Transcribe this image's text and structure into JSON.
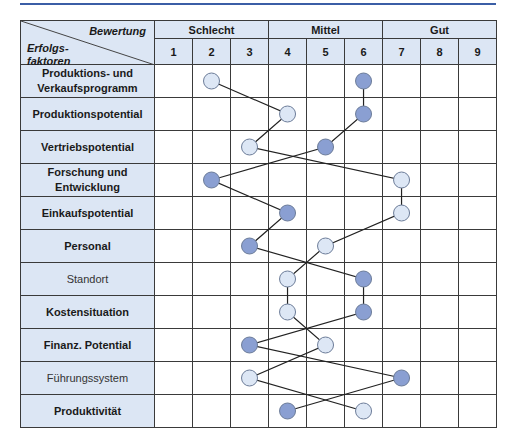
{
  "header": {
    "corner_top": "Bewertung",
    "corner_bottom": "Erfolgs-\nfaktoren",
    "groups": [
      {
        "label": "Schlecht",
        "span": 3
      },
      {
        "label": "Mittel",
        "span": 3
      },
      {
        "label": "Gut",
        "span": 3
      }
    ],
    "scale": [
      "1",
      "2",
      "3",
      "4",
      "5",
      "6",
      "7",
      "8",
      "9"
    ]
  },
  "rows": [
    {
      "label": "Produktions- und Verkaufsprogramm",
      "bold": true,
      "light": 2,
      "dark": 6
    },
    {
      "label": "Produktionspotential",
      "bold": true,
      "light": 4,
      "dark": 6
    },
    {
      "label": "Vertriebspotential",
      "bold": true,
      "light": 3,
      "dark": 5
    },
    {
      "label": "Forschung und Entwicklung",
      "bold": true,
      "light": 7,
      "dark": 2
    },
    {
      "label": "Einkaufspotential",
      "bold": true,
      "light": 7,
      "dark": 4
    },
    {
      "label": "Personal",
      "bold": true,
      "light": 5,
      "dark": 3
    },
    {
      "label": "Standort",
      "bold": false,
      "light": 4,
      "dark": 6
    },
    {
      "label": "Kostensituation",
      "bold": true,
      "light": 4,
      "dark": 6
    },
    {
      "label": "Finanz. Potential",
      "bold": true,
      "light": 5,
      "dark": 3
    },
    {
      "label": "Führungssystem",
      "bold": false,
      "light": 3,
      "dark": 7
    },
    {
      "label": "Produktivität",
      "bold": true,
      "light": 6,
      "dark": 4
    }
  ],
  "colors": {
    "header_fill": "#dce6f4",
    "light_marker": "#dde7f5",
    "dark_marker": "#8a9fd2",
    "marker_stroke": "#6d7d99",
    "line": "#222222",
    "rule": "#3b5ea6"
  },
  "chart_data": {
    "type": "line",
    "xlabel": "Bewertung",
    "ylabel": "Erfolgsfaktoren",
    "x_groups": [
      "Schlecht (1-3)",
      "Mittel (4-6)",
      "Gut (7-9)"
    ],
    "categories": [
      "Produktions- und Verkaufsprogramm",
      "Produktionspotential",
      "Vertriebspotential",
      "Forschung und Entwicklung",
      "Einkaufspotential",
      "Personal",
      "Standort",
      "Kostensituation",
      "Finanz. Potential",
      "Führungssystem",
      "Produktivität"
    ],
    "series": [
      {
        "name": "Profil hell",
        "values": [
          2,
          4,
          3,
          7,
          7,
          5,
          4,
          4,
          5,
          3,
          6
        ]
      },
      {
        "name": "Profil dunkel",
        "values": [
          6,
          6,
          5,
          2,
          4,
          3,
          6,
          6,
          3,
          7,
          4
        ]
      }
    ],
    "xlim": [
      1,
      9
    ],
    "grid": true
  }
}
